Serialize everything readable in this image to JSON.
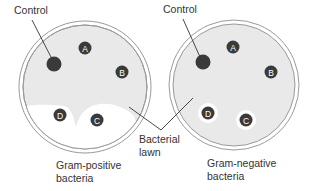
{
  "colors": {
    "agar_lawn": "#e9e9e9",
    "clear_zone": "#ffffff",
    "disc": "#3a3a3a",
    "dish_rim": "#9a9a9a",
    "pointer_line": "#333333",
    "text": "#333333"
  },
  "labels": {
    "control_left": "Control",
    "control_right": "Control",
    "bacterial_lawn_line1": "Bacterial",
    "bacterial_lawn_line2": "lawn",
    "gram_positive_line1": "Gram-positive",
    "gram_positive_line2": "bacteria",
    "gram_negative_line1": "Gram-negative",
    "gram_negative_line2": "bacteria"
  },
  "dishes": [
    {
      "name": "gram-positive-dish",
      "discs": [
        {
          "letter": "",
          "role": "control"
        },
        {
          "letter": "A"
        },
        {
          "letter": "B"
        },
        {
          "letter": "C"
        },
        {
          "letter": "D"
        }
      ]
    },
    {
      "name": "gram-negative-dish",
      "discs": [
        {
          "letter": "",
          "role": "control"
        },
        {
          "letter": "A"
        },
        {
          "letter": "B"
        },
        {
          "letter": "C"
        },
        {
          "letter": "D"
        }
      ]
    }
  ]
}
